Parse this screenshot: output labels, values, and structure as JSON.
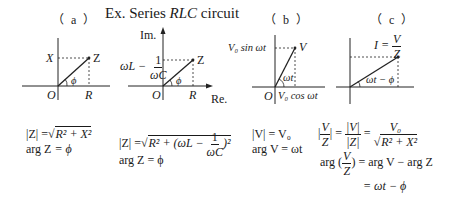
{
  "title": {
    "prefix": "Ex. Series ",
    "emphasis": "RLC",
    "suffix": " circuit"
  },
  "panels": {
    "a": {
      "label": "（ a ）",
      "x_axis_label": "X",
      "point_label": "Z",
      "origin_label": "O",
      "r_label": "R",
      "angle_label": "ϕ",
      "formula_mag_lhs": "|Z|",
      "formula_mag_eq": "=",
      "formula_mag_rhs": "R² + X²",
      "formula_arg_lhs": "arg Z",
      "formula_arg_rhs": "= ϕ"
    },
    "a2": {
      "im_axis_label": "Im.",
      "re_axis_label": "Re.",
      "y_value_prefix": "ωL −",
      "y_value_frac_num": "1",
      "y_value_frac_den": "ωC",
      "point_label": "Z",
      "origin_label": "O",
      "r_label": "R",
      "angle_label": "ϕ",
      "formula_mag_lhs": "|Z| =",
      "formula_mag_rhs_a": "R² + (ωL −",
      "formula_mag_frac_num": "1",
      "formula_mag_frac_den": "ωC",
      "formula_mag_rhs_b": ")²",
      "formula_arg": "arg Z = ϕ"
    },
    "b": {
      "label": "（ b ）",
      "y_label": "V₀ sin ωt",
      "point_label": "V",
      "origin_label": "O",
      "x_label": "V₀ cos ωt",
      "angle_label": "ωt",
      "formula_mag": "|V| = V₀",
      "formula_arg": "arg V = ωt"
    },
    "c": {
      "label": "（ c ）",
      "point_label_lhs": "I =",
      "point_frac_num": "V",
      "point_frac_den": "Z",
      "angle_label": "ωt − ϕ",
      "formula1_frac_num": "V",
      "formula1_frac_den": "Z",
      "formula1_mid_num": "|V|",
      "formula1_mid_den": "|Z|",
      "formula1_rhs_num": "V₀",
      "formula1_rhs_den": "R² + X²",
      "formula2_lhs": "arg",
      "formula2_frac_num": "V",
      "formula2_frac_den": "Z",
      "formula2_rhs": "= arg V − arg Z",
      "formula3": "= ωt − ϕ"
    }
  }
}
